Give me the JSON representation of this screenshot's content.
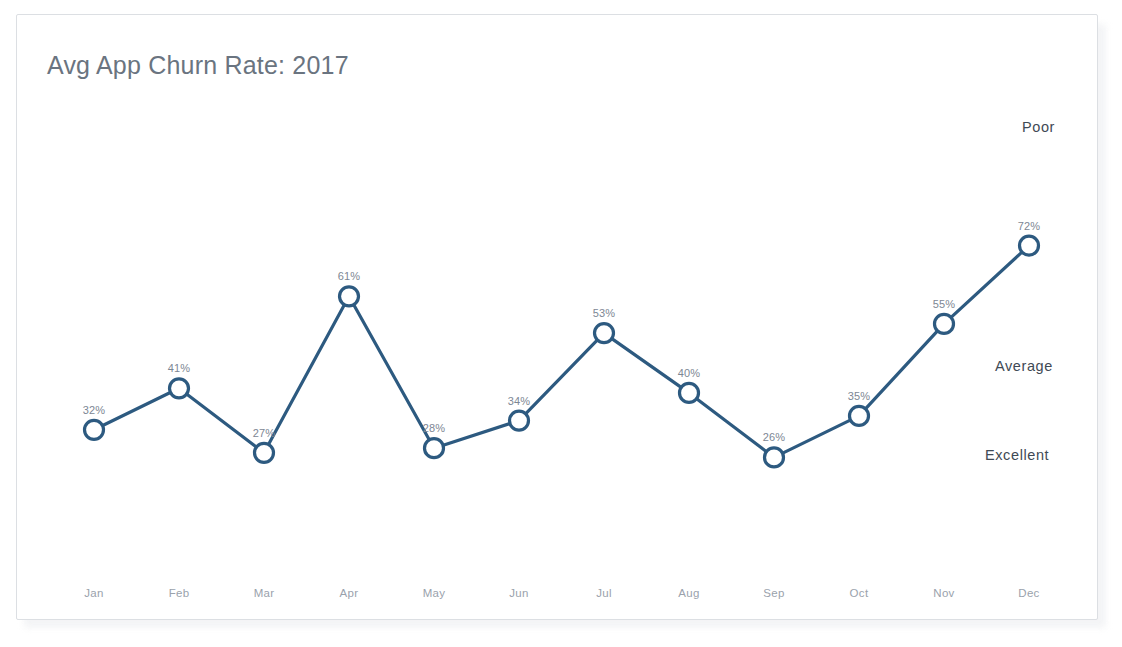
{
  "card": {
    "title": "Avg App Churn Rate: 2017"
  },
  "zones": {
    "poor": "Poor",
    "average": "Average",
    "excellent": "Excellent"
  },
  "colors": {
    "line": "#2d5a80",
    "marker_fill": "#ffffff",
    "title_text": "#6a7480",
    "value_text": "#7d8794",
    "axis_text": "#9aa2ac",
    "zone_text": "#3f4a55",
    "card_border": "#dcdfe3",
    "background": "#ffffff"
  },
  "chart_data": {
    "type": "line",
    "title": "Avg App Churn Rate: 2017",
    "xlabel": "",
    "ylabel": "",
    "ylim": [
      20,
      78
    ],
    "grid": false,
    "legend": "none",
    "categories": [
      "Jan",
      "Feb",
      "Mar",
      "Apr",
      "May",
      "Jun",
      "Jul",
      "Aug",
      "Sep",
      "Oct",
      "Nov",
      "Dec"
    ],
    "values": [
      32,
      41,
      27,
      61,
      28,
      34,
      53,
      40,
      26,
      35,
      55,
      72
    ],
    "data_labels": [
      "32%",
      "41%",
      "27%",
      "61%",
      "28%",
      "34%",
      "53%",
      "40%",
      "26%",
      "35%",
      "55%",
      "72%"
    ],
    "annotations": [
      {
        "text": "Poor",
        "position": "right-top"
      },
      {
        "text": "Average",
        "position": "right-middle"
      },
      {
        "text": "Excellent",
        "position": "right-bottom"
      }
    ],
    "marker": "open-circle",
    "series": [
      {
        "name": "Avg App Churn Rate",
        "values": [
          32,
          41,
          27,
          61,
          28,
          34,
          53,
          40,
          26,
          35,
          55,
          72
        ]
      }
    ]
  }
}
